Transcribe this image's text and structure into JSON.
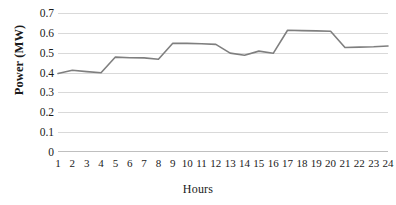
{
  "chart_data": {
    "type": "line",
    "title": "",
    "xlabel": "Hours",
    "ylabel": "Power (MW)",
    "categories": [
      "1",
      "2",
      "3",
      "4",
      "5",
      "6",
      "7",
      "8",
      "9",
      "10",
      "11",
      "12",
      "13",
      "14",
      "15",
      "16",
      "17",
      "18",
      "19",
      "20",
      "21",
      "22",
      "23",
      "24"
    ],
    "values": [
      0.395,
      0.412,
      0.405,
      0.399,
      0.478,
      0.475,
      0.474,
      0.467,
      0.548,
      0.547,
      0.545,
      0.542,
      0.498,
      0.487,
      0.508,
      0.497,
      0.613,
      0.611,
      0.61,
      0.608,
      0.526,
      0.528,
      0.53,
      0.534
    ],
    "series": [
      {
        "name": "Power",
        "values": [
          0.395,
          0.412,
          0.405,
          0.399,
          0.478,
          0.475,
          0.474,
          0.467,
          0.548,
          0.547,
          0.545,
          0.542,
          0.498,
          0.487,
          0.508,
          0.497,
          0.613,
          0.611,
          0.61,
          0.608,
          0.526,
          0.528,
          0.53,
          0.534
        ],
        "color": "#7f7f7f"
      }
    ],
    "ylim": [
      0,
      0.7
    ],
    "yticks": [
      "0",
      "0.1",
      "0.2",
      "0.3",
      "0.4",
      "0.5",
      "0.6",
      "0.7"
    ],
    "ytick_values": [
      0,
      0.1,
      0.2,
      0.3,
      0.4,
      0.5,
      0.6,
      0.7
    ],
    "grid": true,
    "legend": "none",
    "gridline_color": "#d9d9d9",
    "line_color": "#7f7f7f",
    "text_color": "#1a1a1a",
    "background": "#ffffff"
  }
}
